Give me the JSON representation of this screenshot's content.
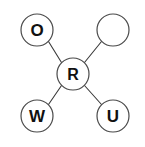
{
  "diagram": {
    "type": "node-link-star-graph",
    "background_color": "#ffffff",
    "node_stroke_color": "#4a4a4a",
    "node_fill_color": "#ffffff",
    "edge_color": "#3a3a3a",
    "label_color": "#111111",
    "center_node": {
      "id": "R",
      "label": "R",
      "cx": 73,
      "cy": 74,
      "r": 16
    },
    "outer_nodes": [
      {
        "id": "O",
        "label": "O",
        "position": "top-left",
        "cx": 37,
        "cy": 30,
        "r": 16
      },
      {
        "id": "blank",
        "label": "",
        "position": "top-right",
        "cx": 113,
        "cy": 30,
        "r": 16
      },
      {
        "id": "W",
        "label": "W",
        "position": "bottom-left",
        "cx": 37,
        "cy": 116,
        "r": 16
      },
      {
        "id": "U",
        "label": "U",
        "position": "bottom-right",
        "cx": 113,
        "cy": 116,
        "r": 16
      }
    ],
    "edges": [
      {
        "from": "R",
        "to": "O",
        "x1": 61.5,
        "y1": 62.5,
        "x2": 48.5,
        "y2": 41.5
      },
      {
        "from": "R",
        "to": "blank",
        "x1": 84.5,
        "y1": 62.5,
        "x2": 101.5,
        "y2": 41.5
      },
      {
        "from": "R",
        "to": "W",
        "x1": 61.5,
        "y1": 85.5,
        "x2": 48.5,
        "y2": 104.5
      },
      {
        "from": "R",
        "to": "U",
        "x1": 84.5,
        "y1": 85.5,
        "x2": 101.5,
        "y2": 104.5
      }
    ]
  }
}
